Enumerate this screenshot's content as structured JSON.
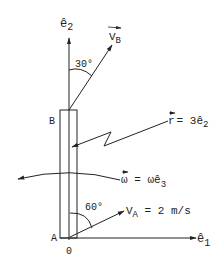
{
  "diagram": {
    "axes": {
      "e2_label": "ê",
      "e2_sub": "2",
      "e1_label": "ê",
      "e1_sub": "1",
      "origin_label": "0"
    },
    "points": {
      "A": "A",
      "B": "B"
    },
    "velocity_B": {
      "label": "V",
      "sub": "B",
      "angle_label": "30°"
    },
    "velocity_A": {
      "label": "V",
      "sub": "A",
      "value": " = 2 m/s",
      "angle_label": "60°"
    },
    "position": {
      "label": "r",
      "value": "= 3ê",
      "sub": "2"
    },
    "angular_velocity": {
      "label": "ω",
      "value": " = ωê",
      "sub": "3"
    },
    "colors": {
      "ink": "#222222",
      "background": "#ffffff"
    }
  }
}
